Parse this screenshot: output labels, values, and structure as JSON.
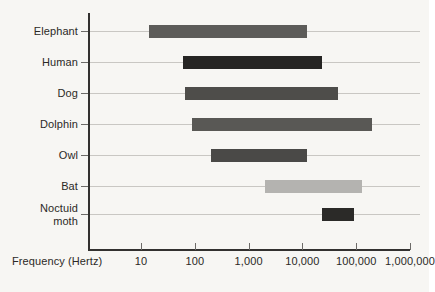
{
  "figure": {
    "background_color": "#f7f6f3",
    "axis_color": "#33312f",
    "gridline_color": "#c9c7c3",
    "text_color": "#2b2926"
  },
  "axis": {
    "x_title": "Frequency (Hertz)",
    "x_tick_labels": [
      "10",
      "100",
      "1,000",
      "10,000",
      "100,000",
      "1,000,000"
    ],
    "x_tick_values": [
      10,
      100,
      1000,
      10000,
      100000,
      1000000
    ],
    "scale": "log10"
  },
  "chart_data": {
    "type": "bar",
    "orientation": "horizontal",
    "subtype": "range-bar (floating bar / span chart)",
    "title": "",
    "subtitle": "",
    "xlabel": "Frequency (Hertz)",
    "ylabel": "",
    "xscale": "log",
    "xlim": [
      10,
      1000000
    ],
    "grid": true,
    "grid_axis": "y",
    "legend": "none",
    "categories": [
      "Elephant",
      "Human",
      "Dog",
      "Dolphin",
      "Owl",
      "Bat",
      "Noctuid moth"
    ],
    "series": [
      {
        "name": "Hearing range (low)",
        "values": [
          14,
          60,
          65,
          90,
          200,
          2000,
          23000
        ]
      },
      {
        "name": "Hearing range (high)",
        "values": [
          12000,
          23000,
          45000,
          200000,
          12000,
          130000,
          90000
        ]
      }
    ],
    "bars": [
      {
        "category": "Elephant",
        "low": 14,
        "high": 12000,
        "color": "#5d5c59"
      },
      {
        "category": "Human",
        "low": 60,
        "high": 23000,
        "color": "#262523"
      },
      {
        "category": "Dog",
        "low": 65,
        "high": 45000,
        "color": "#4e4d4a"
      },
      {
        "category": "Dolphin",
        "low": 90,
        "high": 200000,
        "color": "#595855"
      },
      {
        "category": "Owl",
        "low": 200,
        "high": 12000,
        "color": "#4a4947"
      },
      {
        "category": "Bat",
        "low": 2000,
        "high": 130000,
        "color": "#b4b3b0"
      },
      {
        "category": "Noctuid moth",
        "low": 23000,
        "high": 90000,
        "color": "#2b2a28"
      }
    ]
  },
  "categories_display": [
    {
      "label": "Elephant"
    },
    {
      "label": "Human"
    },
    {
      "label": "Dog"
    },
    {
      "label": "Dolphin"
    },
    {
      "label": "Owl"
    },
    {
      "label": "Bat"
    },
    {
      "label": "Noctuid\nmoth"
    }
  ]
}
